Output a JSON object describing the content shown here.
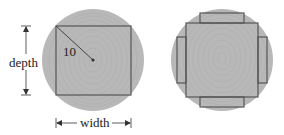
{
  "figure": {
    "left_panel": {
      "title": "square beam cut from circular log",
      "radius_label": "10",
      "depth_label": "depth",
      "width_label": "width"
    },
    "right_panel": {
      "title": "square beam with four side planks"
    }
  },
  "colors": {
    "log_fill": "#b8b8b8",
    "ring_stroke": "#a9a9a9",
    "cut_line": "#555555",
    "dimension_line": "#333333",
    "text": "#222222"
  }
}
